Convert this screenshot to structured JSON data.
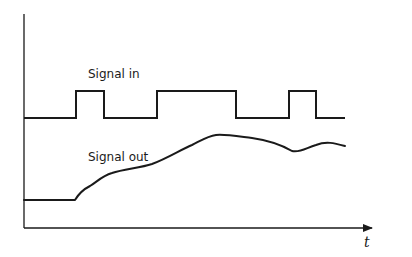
{
  "diagram": {
    "type": "signal-timing-diagram",
    "labels": {
      "signal_in": "Signal in",
      "signal_out": "Signal out",
      "x_axis": "t"
    },
    "colors": {
      "line": "#1a1a1a",
      "background": "#ffffff"
    },
    "axes": {
      "origin": [
        24,
        228
      ],
      "y_top": 14,
      "x_end": 376
    },
    "signal_in": {
      "low_y": 118,
      "high_y": 91,
      "start_x": 24,
      "end_x": 345,
      "pulses": [
        {
          "rise_x": 76,
          "fall_x": 104
        },
        {
          "rise_x": 157,
          "fall_x": 236
        },
        {
          "rise_x": 289,
          "fall_x": 316
        }
      ]
    },
    "signal_out": {
      "path": "M24,200 L75,200 C78,195 82,190 90,186 C98,181 102,176 112,173 C124,169 140,168 152,164 C168,158 180,150 192,145 C202,140 208,136 216,135 C224,134 236,136 252,138 C266,140 280,144 292,151 C300,153 306,148 316,145 C326,141 334,143 345,146"
    }
  }
}
